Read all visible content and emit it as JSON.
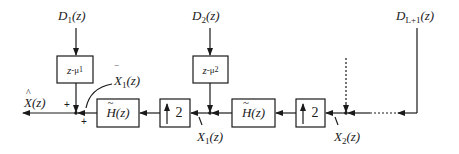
{
  "diagram": {
    "type": "block-diagram",
    "output": {
      "symbol": "X",
      "accent": "^",
      "arg": "(z)",
      "label": "X̂(z)"
    },
    "inputs": [
      {
        "id": "D1",
        "symbol": "D",
        "sub": "1",
        "arg": "(z)",
        "label": "D1(z)"
      },
      {
        "id": "D2",
        "symbol": "D",
        "sub": "2",
        "arg": "(z)",
        "label": "D2(z)"
      },
      {
        "id": "DL1",
        "symbol": "D",
        "sub": "L+1",
        "arg": "(z)",
        "label": "DL+1(z)"
      }
    ],
    "delay_blocks": [
      {
        "id": "delay1",
        "base": "z",
        "exp": "-μ",
        "sub": "1",
        "label": "z^-μ1"
      },
      {
        "id": "delay2",
        "base": "z",
        "exp": "-μ",
        "sub": "2",
        "label": "z^-μ2"
      }
    ],
    "filter_blocks": [
      {
        "id": "H1",
        "symbol": "H",
        "accent": "~",
        "arg": "(z)",
        "label": "H̃(z)"
      },
      {
        "id": "H2",
        "symbol": "H",
        "accent": "~",
        "arg": "(z)",
        "label": "H̃(z)"
      }
    ],
    "upsampler_blocks": [
      {
        "id": "up1",
        "arrow": "↑",
        "factor": "2",
        "label": "↑2"
      },
      {
        "id": "up2",
        "arrow": "↑",
        "factor": "2",
        "label": "↑2"
      }
    ],
    "signals": [
      {
        "id": "Xbar1",
        "symbol": "X",
        "accent": "‾",
        "sub": "1",
        "arg": "(z)",
        "label": "X̄1(z)"
      },
      {
        "id": "X1",
        "symbol": "X",
        "sub": "1",
        "arg": "(z)",
        "label": "X1(z)"
      },
      {
        "id": "X2",
        "symbol": "X",
        "sub": "2",
        "arg": "(z)",
        "label": "X2(z)"
      }
    ],
    "summing_signs": [
      "+",
      "+"
    ],
    "colors": {
      "line": "#1a1a1a",
      "background": "#ffffff"
    }
  }
}
